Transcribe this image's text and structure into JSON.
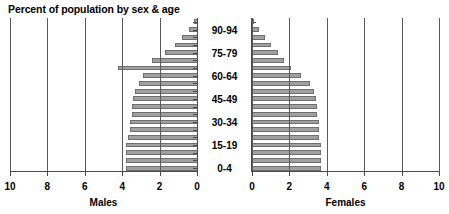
{
  "chart_data": {
    "type": "bar",
    "title": "Percent of population by sex & age",
    "subtitle": "",
    "orientation": "horizontal",
    "layout": "population-pyramid",
    "grid": true,
    "legend": "none",
    "xlabel_left": "Males",
    "xlabel_right": "Females",
    "ylabel": "",
    "xlim_left": [
      10,
      0
    ],
    "xlim_right": [
      0,
      10
    ],
    "xticks_left": [
      "10",
      "8",
      "6",
      "4",
      "2",
      "0"
    ],
    "xticks_right": [
      "0",
      "2",
      "4",
      "6",
      "8",
      "10"
    ],
    "xtick_values_left": [
      10,
      8,
      6,
      4,
      2,
      0
    ],
    "xtick_values_right": [
      0,
      2,
      4,
      6,
      8,
      10
    ],
    "categories": [
      "0-4",
      "5-9",
      "10-14",
      "15-19",
      "20-24",
      "25-29",
      "30-34",
      "35-39",
      "40-44",
      "45-49",
      "50-54",
      "55-59",
      "60-64",
      "65-69",
      "70-74",
      "75-79",
      "80-84",
      "85-89",
      "90-94",
      "95+"
    ],
    "visible_category_labels": [
      "90-94",
      "75-79",
      "60-64",
      "45-49",
      "30-34",
      "15-19",
      "0-4"
    ],
    "series": [
      {
        "name": "Males",
        "side": "left",
        "values": [
          3.8,
          3.8,
          3.8,
          3.8,
          3.7,
          3.6,
          3.6,
          3.5,
          3.5,
          3.4,
          3.3,
          3.1,
          2.9,
          4.2,
          2.4,
          1.7,
          1.2,
          0.8,
          0.45,
          0.15
        ]
      },
      {
        "name": "Females",
        "side": "right",
        "values": [
          3.7,
          3.7,
          3.7,
          3.7,
          3.6,
          3.6,
          3.6,
          3.5,
          3.5,
          3.4,
          3.3,
          3.1,
          2.6,
          2.1,
          1.7,
          1.4,
          1.0,
          0.7,
          0.35,
          0.12
        ]
      }
    ],
    "bar_color": "#a0a0a0",
    "bar_edge_color": "#6f6f6f",
    "gridline_color": "#5a5a5a",
    "axis_color": "#4a4a4a",
    "background": "#ffffff"
  }
}
